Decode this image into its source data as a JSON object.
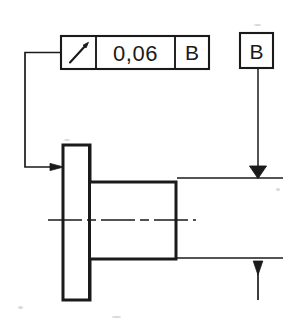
{
  "drawing": {
    "title": "Circular runout tolerance callout on flanged shaft",
    "background_color": "#ffffff",
    "line_color": "#1a1a1a",
    "feature_control_frame": {
      "name": "feature-control-frame",
      "symbol_cell": {
        "icon": "circular-runout-arrow-icon",
        "meaning": "circular runout"
      },
      "tolerance_value": "0,06",
      "datum_reference": "B"
    },
    "datum_feature_symbol": {
      "letter": "B",
      "indicator": "filled-datum-triangle"
    },
    "leader": {
      "from": "feature-control-frame",
      "to": "flange-left-face",
      "arrow": "solid-arrowhead-right"
    },
    "dimension_arrow": {
      "direction": "down",
      "arrow": "solid-arrowhead-down"
    },
    "part": {
      "flange": "flange-rectangle",
      "boss": "boss-rectangle",
      "axis": "centerline-dash-dot"
    }
  },
  "geometry": {
    "fcf": {
      "x": 61,
      "y": 36,
      "w": 148,
      "h": 33,
      "div1": 96,
      "div2": 175
    },
    "datum_box": {
      "x": 240,
      "y": 33,
      "w": 33,
      "h": 35
    },
    "flange": {
      "x": 63,
      "y": 145,
      "w": 27,
      "h": 155
    },
    "boss": {
      "x": 88,
      "y": 182,
      "w": 88,
      "h": 77
    },
    "centerline": {
      "y": 220,
      "x1": 48,
      "x2": 196
    },
    "ext_top": {
      "y": 178,
      "x1": 177,
      "x2": 283
    },
    "ext_bottom": {
      "y": 258,
      "x1": 177,
      "x2": 283
    },
    "datum_leader_x": 258,
    "dim_arrow_x": 258
  }
}
